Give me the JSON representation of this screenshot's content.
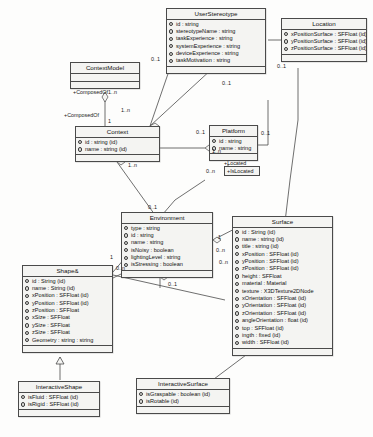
{
  "diagram": {
    "type": "uml-class-diagram",
    "classes": [
      {
        "key": "userStereotype",
        "name": "UserStereotype",
        "attributes": [
          "id : string",
          "stereotypeName : string",
          "taskExperience : string",
          "systemExperience : string",
          "deviceExperience : string",
          "taskMotivation : string"
        ]
      },
      {
        "key": "location",
        "name": "Location",
        "attributes": [
          "xPositionSurface : SFFloat (id)",
          "yPositionSurface : SFFloat (id)",
          "zPositionSurface : SFFloat (id)"
        ]
      },
      {
        "key": "contextModel",
        "name": "ContextModel",
        "attributes": []
      },
      {
        "key": "context",
        "name": "Context",
        "attributes": [
          "id : string (id)",
          "name : string (id)"
        ]
      },
      {
        "key": "platform",
        "name": "Platform",
        "attributes": [
          "id : string",
          "name : string"
        ]
      },
      {
        "key": "environment",
        "name": "Environment",
        "attributes": [
          "type : string",
          "id : string",
          "name : string",
          "isNoisy : boolean",
          "lightingLevel : string",
          "isStressing : boolean"
        ]
      },
      {
        "key": "surface",
        "name": "Surface",
        "attributes": [
          "id : String (id)",
          "name : string (id)",
          "title : string (id)",
          "xPosition : SFFloat (id)",
          "yPosition : SFFloat (id)",
          "zPosition : SFFloat (id)",
          "height : SFFloat",
          "material : Material",
          "texture : X3DTexture2DNode",
          "xOrientation : SFFloat (id)",
          "yOrientation : SFFloat (id)",
          "zOrientation : SFFloat (id)",
          "angleOrientation : float (id)",
          "top : SFFloat (id)",
          "ingth : fixed (id)",
          "width : SFFloat (id)"
        ]
      },
      {
        "key": "shape",
        "name": "Shape&",
        "attributes": [
          "id : String (id)",
          "name : String (id)",
          "xPosition : SFFloat (id)",
          "yPosition : SFFloat (id)",
          "zPosition : SFFloat",
          "xSize : SFFloat",
          "ySize : SFFloat",
          "zSize : SFFloat",
          "Geometry : string : string"
        ]
      },
      {
        "key": "interactiveShape",
        "name": "InteractiveShape",
        "attributes": [
          "isFluid : SFFloat (id)",
          "isRigid : SFFloat (id)"
        ]
      },
      {
        "key": "interactiveSurface",
        "name": "InteractiveSurface",
        "attributes": [
          "isGraspable : boolean (id)",
          "isRotable (id)"
        ]
      }
    ],
    "labels": {
      "composed_of_role": "+ComposedOf",
      "composed_of_mult": "1..n",
      "contextmodel_mult_one": "1",
      "context_right_mult": "1..n",
      "context_bottom_mult": "1..n",
      "stereotype_left_mult": "0..1",
      "stereotype_bottom_mult": "0..1",
      "stereotype_to_context_mult": "1..n",
      "platform_left_mult": "0..1",
      "platform_right_mult": "0..1",
      "located_role": "+Located",
      "is_located_role": "+IsLocated",
      "located_mult": "0..n",
      "environment_top_mult": "0..1",
      "environment_bottom_mult": "0..1",
      "environment_right_mult": "0..n",
      "environment_one_mult": "1",
      "surface_left_mult": "0..n",
      "shape_right_mult": "0..n",
      "shape_one_mult": "1",
      "location_mult": "0..1"
    }
  }
}
